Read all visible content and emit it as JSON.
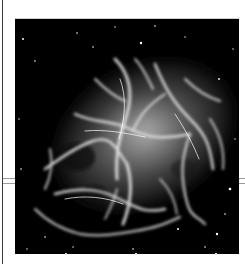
{
  "page": {
    "background": "#ffffff"
  },
  "caption": {
    "text": "",
    "note_visible": "clipped, illegible text fragment at top edge"
  },
  "figure": {
    "alt": "Grayscale image of a supernova remnant nebula with bright filaments on a black starfield",
    "colors": {
      "sky": "#000000",
      "core_glow": "#8c8c8c",
      "filaments": "#e8e8e8",
      "stars": "#ffffff"
    }
  },
  "layout_lines": {
    "left_vertical_rule": true,
    "horizontal_split_rule_y": 180
  }
}
